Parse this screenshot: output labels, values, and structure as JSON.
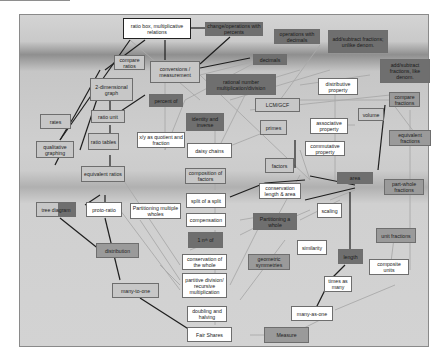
{
  "diagram": {
    "type": "concept map",
    "title": "",
    "nodes": [
      {
        "id": "ratio_box",
        "label": "ratio box, multiplicative relations",
        "shade": "white",
        "bold": true
      },
      {
        "id": "change_percents",
        "label": "change/operations with percents",
        "shade": "dark"
      },
      {
        "id": "ops_decimals",
        "label": "operations with decimals",
        "shade": "dark"
      },
      {
        "id": "add_unlike",
        "label": "add/subtract fractions; unlike denom.",
        "shade": "dark"
      },
      {
        "id": "compare_ratios",
        "label": "compare ratios",
        "shade": "light"
      },
      {
        "id": "conversions",
        "label": "conversions / measurement",
        "shade": "light"
      },
      {
        "id": "decimals",
        "label": "decimals",
        "shade": "dark"
      },
      {
        "id": "add_like",
        "label": "add/subtract fractions, like denom.",
        "shade": "dark"
      },
      {
        "id": "two_d_graph",
        "label": "2-dimensional graph",
        "shade": "light"
      },
      {
        "id": "rational_mult",
        "label": "rational number multiplication/division",
        "shade": "dark"
      },
      {
        "id": "distributive",
        "label": "distributive property",
        "shade": "white"
      },
      {
        "id": "percent_of",
        "label": "percent of",
        "shade": "dark"
      },
      {
        "id": "lcm_gcf",
        "label": "LCM/GCF",
        "shade": "light"
      },
      {
        "id": "compare_fractions",
        "label": "compare fractions",
        "shade": "medium"
      },
      {
        "id": "volume",
        "label": "volume",
        "shade": "light"
      },
      {
        "id": "rates",
        "label": "rates",
        "shade": "light"
      },
      {
        "id": "ratio_unit",
        "label": "ratio unit",
        "shade": "light"
      },
      {
        "id": "identity_inverse",
        "label": "identity and inverse",
        "shade": "dark"
      },
      {
        "id": "associative",
        "label": "associative property",
        "shade": "white"
      },
      {
        "id": "primes",
        "label": "primes",
        "shade": "light"
      },
      {
        "id": "equivalent_fractions",
        "label": "equivalent fractions",
        "shade": "medium"
      },
      {
        "id": "x_y_quotient",
        "label": "x/y as quotient and fraction",
        "shade": "white"
      },
      {
        "id": "ratio_tables",
        "label": "ratio tables",
        "shade": "light"
      },
      {
        "id": "qualitative_graphing",
        "label": "qualitative graphing",
        "shade": "light"
      },
      {
        "id": "commutative",
        "label": "commutative property",
        "shade": "white"
      },
      {
        "id": "daisy_chains",
        "label": "daisy chains",
        "shade": "white"
      },
      {
        "id": "factors",
        "label": "factors",
        "shade": "light"
      },
      {
        "id": "equivalent_ratios",
        "label": "equivalent ratios",
        "shade": "light"
      },
      {
        "id": "composition_factors",
        "label": "composition of factors",
        "shade": "light"
      },
      {
        "id": "area",
        "label": "area",
        "shade": "dark"
      },
      {
        "id": "part_whole",
        "label": "part-whole fractions",
        "shade": "medium"
      },
      {
        "id": "conservation_length_area",
        "label": "conservation length & area",
        "shade": "white"
      },
      {
        "id": "tree_diagram",
        "label": "tree diagram",
        "shade": "split"
      },
      {
        "id": "proto_ratio",
        "label": "proto-ratio",
        "shade": "white"
      },
      {
        "id": "partitioning_multiple",
        "label": "Partitioning multiple wholes",
        "shade": "white"
      },
      {
        "id": "split_of_split",
        "label": "split of a split",
        "shade": "white"
      },
      {
        "id": "scaling",
        "label": "scaling",
        "shade": "white"
      },
      {
        "id": "compensation",
        "label": "compensation",
        "shade": "white"
      },
      {
        "id": "partitioning_whole",
        "label": "Partitioning a whole",
        "shade": "dark"
      },
      {
        "id": "unit_fractions",
        "label": "unit fractions",
        "shade": "medium"
      },
      {
        "id": "one_nth_of",
        "label": "1 nᵗʰ of",
        "shade": "dark"
      },
      {
        "id": "distribution",
        "label": "distribution",
        "shade": "medium"
      },
      {
        "id": "similarity",
        "label": "similarity",
        "shade": "white"
      },
      {
        "id": "conservation_whole",
        "label": "conservation of the whole",
        "shade": "white"
      },
      {
        "id": "geometric_symmetries",
        "label": "geometric symmetries",
        "shade": "medium"
      },
      {
        "id": "length",
        "label": "length",
        "shade": "dark"
      },
      {
        "id": "composite_units",
        "label": "composite units",
        "shade": "white"
      },
      {
        "id": "partitive_division",
        "label": "partitive division/ recursive multiplication",
        "shade": "white"
      },
      {
        "id": "times_as_many",
        "label": "times as many",
        "shade": "white"
      },
      {
        "id": "many_to_one",
        "label": "many-to-one",
        "shade": "light"
      },
      {
        "id": "doubling_halving",
        "label": "doubling and halving",
        "shade": "white"
      },
      {
        "id": "many_as_one",
        "label": "many-as-one",
        "shade": "white"
      },
      {
        "id": "fair_shares",
        "label": "Fair Shares",
        "shade": "white"
      },
      {
        "id": "measure",
        "label": "Measure",
        "shade": "medium"
      }
    ],
    "colors": {
      "white": "#ffffff",
      "light": "#c7c7c7",
      "medium": "#9a9a9a",
      "dark": "#6f6f6f",
      "strong_edge": "#1e1e1e",
      "weak_edge": "#a8a8a8"
    }
  }
}
